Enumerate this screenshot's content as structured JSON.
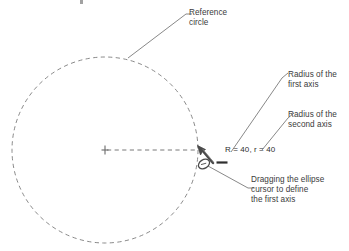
{
  "diagram": {
    "colors": {
      "text": "#3b3b3b",
      "line": "#6a6a6a",
      "circle": "#7a7a7a",
      "cursor": "#4a4a4a",
      "background": "#ffffff"
    },
    "annotations": {
      "reference_circle": {
        "line1": "Reference",
        "line2": "circle"
      },
      "radius_first_axis": {
        "line1": "Radius of the",
        "line2": "first axis"
      },
      "radius_second_axis": {
        "line1": "Radius of the",
        "line2": "second axis"
      },
      "dimension_readout": "R = 40, r = 40",
      "dragging_note": {
        "line1": "Dragging the ellipse",
        "line2": "cursor to define",
        "line3": "the first axis"
      }
    },
    "geometry": {
      "circle_center_x": 105,
      "circle_center_y": 150,
      "circle_radius": 93,
      "radius_line_end_x": 198,
      "cursor_x": 203,
      "cursor_y": 150
    },
    "values": {
      "major_radius_label": "R",
      "major_radius_value": "40",
      "minor_radius_label": "r",
      "minor_radius_value": "40"
    },
    "icons": {
      "cursor": "ellipse-cursor-icon",
      "center_mark": "center-mark-icon"
    }
  }
}
